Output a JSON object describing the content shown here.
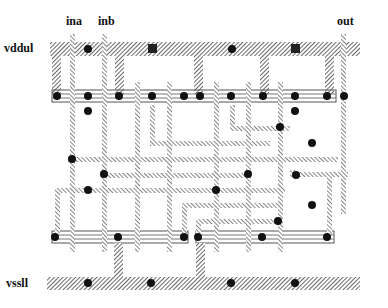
{
  "diagram": {
    "type": "VLSI stick layout (CMOS cell)",
    "labels": {
      "vdd": "vddul",
      "vss": "vssll",
      "input_a": "ina",
      "input_b": "inb",
      "output": "out"
    },
    "colors": {
      "metal": "#555555",
      "poly": "#777777",
      "contact": "#111111",
      "diffusion": "#666666",
      "background": "#ffffff"
    },
    "rails": [
      {
        "name": "vdd-rail",
        "label_key": "vdd"
      },
      {
        "name": "vss-rail",
        "label_key": "vss"
      }
    ],
    "diffusion_rows": [
      {
        "name": "pmos-diffusion",
        "type": "p"
      },
      {
        "name": "nmos-diffusion-left",
        "type": "n"
      },
      {
        "name": "nmos-diffusion-right",
        "type": "n"
      }
    ],
    "contact_count": 34
  }
}
